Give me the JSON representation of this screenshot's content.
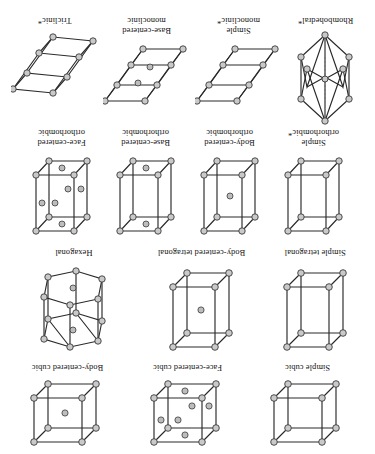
{
  "figure": {
    "orientation": "rotated-180",
    "background_color": "#ffffff",
    "atom_fill_color": "#c9c9c9",
    "atom_stroke_color": "#3a3a3a",
    "edge_color": "#2a2a2a",
    "hidden_edge_color": "#6e6e6e"
  },
  "rows": [
    {
      "name": "cubic-row",
      "cells": [
        {
          "label": "Simple cubic",
          "shape": "cube",
          "interior_atoms": "none",
          "corner_atoms": 8
        },
        {
          "label": "Face-centered cubic",
          "shape": "cube",
          "interior_atoms": "face-centers",
          "corner_atoms": 8,
          "extra_atoms": 6
        },
        {
          "label": "Body-centered cubic",
          "shape": "cube",
          "interior_atoms": "body-center",
          "corner_atoms": 8,
          "extra_atoms": 1
        }
      ]
    },
    {
      "name": "tetragonal-hexagonal-row",
      "cells": [
        {
          "label": "Simple tetragonal",
          "shape": "prism",
          "interior_atoms": "none",
          "corner_atoms": 8
        },
        {
          "label": "Body-centered tetragonal",
          "shape": "prism",
          "interior_atoms": "body-center",
          "corner_atoms": 8,
          "extra_atoms": 1
        },
        {
          "label": "Hexagonal",
          "shape": "hexagonal-prism",
          "interior_atoms": "basal-centers",
          "corner_atoms": 12,
          "extra_atoms": 2
        }
      ]
    },
    {
      "name": "orthorhombic-row",
      "cells": [
        {
          "label": "Simple\northorhombic*",
          "shape": "prism",
          "interior_atoms": "none",
          "corner_atoms": 8
        },
        {
          "label": "Body-centered\northorhombic",
          "shape": "prism",
          "interior_atoms": "body-center",
          "corner_atoms": 8,
          "extra_atoms": 1
        },
        {
          "label": "Base-centered\northorhombic",
          "shape": "prism",
          "interior_atoms": "base-centers",
          "corner_atoms": 8,
          "extra_atoms": 2
        },
        {
          "label": "Face-centered\northorhombic",
          "shape": "prism",
          "interior_atoms": "face-centers",
          "corner_atoms": 8,
          "extra_atoms": 6
        }
      ]
    },
    {
      "name": "monoclinic-triclinic-row",
      "cells": [
        {
          "label": "Rhombohedral*",
          "shape": "rhombohedron",
          "interior_atoms": "none",
          "corner_atoms": 8
        },
        {
          "label": "Simple\nmonoclinic*",
          "shape": "sheared",
          "interior_atoms": "none",
          "corner_atoms": 8
        },
        {
          "label": "Base-centered\nmonoclinic",
          "shape": "sheared",
          "interior_atoms": "base-centers",
          "corner_atoms": 8,
          "extra_atoms": 2
        },
        {
          "label": "Triclinic*",
          "shape": "sheared",
          "interior_atoms": "none",
          "corner_atoms": 8
        }
      ]
    }
  ]
}
